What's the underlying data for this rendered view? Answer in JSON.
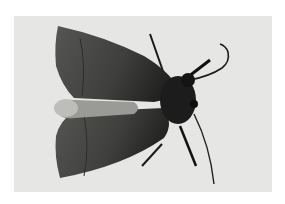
{
  "image": {
    "subject": "moth",
    "alt": "Grayscale photograph of a moth with folded wings on a light background",
    "colors": {
      "background": "#e6e6e4",
      "wing": "#4a4a48",
      "wing_dark": "#2e2e2c",
      "body": "#1c1c1c",
      "highlight": "#bdbdb9"
    }
  }
}
